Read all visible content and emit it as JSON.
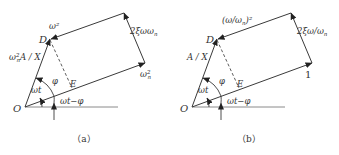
{
  "figure": {
    "panels": [
      {
        "caption": "（a）",
        "labels": {
          "origin": "O",
          "point_d": "D",
          "point_e": "E",
          "top_edge": "ω²",
          "right_edge": "2ξωω",
          "right_edge_sub": "n",
          "bottom_right": "ω",
          "bottom_right_sup": "2",
          "bottom_right_sub": "n",
          "left_edge_prefix": "ω",
          "left_edge_sup": "2",
          "left_edge_sub": "n",
          "left_edge_suffix": "A / X",
          "angle_wt": "ωt",
          "angle_phi": "φ",
          "angle_wt_minus_phi": "ωt−φ",
          "reference_arrow": "I"
        }
      },
      {
        "caption": "（b）",
        "labels": {
          "origin": "O",
          "point_d": "D",
          "point_e": "E",
          "top_edge": "(ω/ω",
          "top_edge_sub": "n",
          "top_edge_suffix": ")²",
          "right_edge": "2ξω/ω",
          "right_edge_sub": "n",
          "bottom_right": "1",
          "left_edge": "A / X",
          "angle_wt": "ωt",
          "angle_phi": "φ",
          "angle_wt_minus_phi": "ωt−φ",
          "reference_arrow": "I"
        }
      }
    ]
  }
}
